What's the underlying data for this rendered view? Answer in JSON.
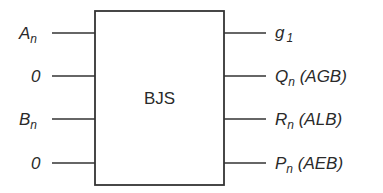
{
  "block": {
    "label": "BJS"
  },
  "inputs": [
    {
      "main": "A",
      "sub": "n",
      "y": 33
    },
    {
      "main": "0",
      "sub": "",
      "y": 76
    },
    {
      "main": "B",
      "sub": "n",
      "y": 119
    },
    {
      "main": "0",
      "sub": "",
      "y": 163
    }
  ],
  "outputs": [
    {
      "main": "g",
      "sub": "1",
      "suffix": "",
      "y": 33
    },
    {
      "main": "Q",
      "sub": "n",
      "suffix": " (AGB)",
      "y": 76
    },
    {
      "main": "R",
      "sub": "n",
      "suffix": " (ALB)",
      "y": 119
    },
    {
      "main": "P",
      "sub": "n",
      "suffix": " (AEB)",
      "y": 163
    }
  ]
}
